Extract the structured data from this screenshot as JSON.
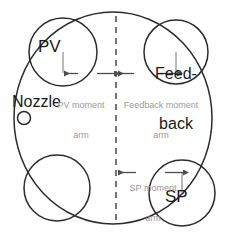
{
  "diagram": {
    "colors": {
      "outline": "#2b2b2b",
      "label_text": "#1a1a1a",
      "caption_text": "#9a9a9a",
      "arrow": "#4d4d4d",
      "leader_line": "#8c8c8c",
      "background": "#ffffff"
    },
    "labels": {
      "pv": "PV",
      "sp": "SP",
      "nozzle": "Nozzle",
      "feedback_line1": "Feed-",
      "feedback_line2": "back"
    },
    "captions": {
      "pv_arm_line1": "PV moment",
      "pv_arm_line2": "arm",
      "feedback_arm_line1": "Feedback moment",
      "feedback_arm_line2": "arm",
      "sp_arm_line1": "SP moment",
      "sp_arm_line2": "arm"
    }
  }
}
